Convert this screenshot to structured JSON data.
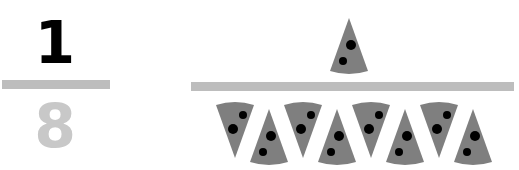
{
  "fraction": {
    "numerator": "1",
    "denominator": "8"
  },
  "colors": {
    "numerator": "#000000",
    "denominator": "#c8c8c8",
    "bar": "#bdbdbd",
    "slice": "#7f7f7f",
    "topping": "#000000"
  },
  "pictorial": {
    "numerator_slices": 1,
    "denominator_slices": 8
  }
}
